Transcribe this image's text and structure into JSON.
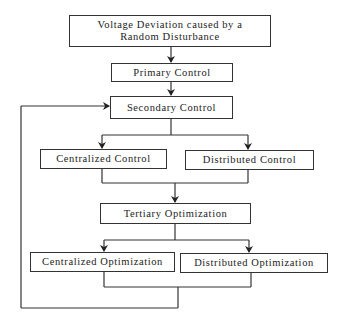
{
  "diagram": {
    "type": "flowchart",
    "nodes": {
      "disturbance": {
        "line1": "Voltage Deviation caused by a",
        "line2": "Random Disturbance"
      },
      "primary": {
        "label": "Primary Control"
      },
      "secondary": {
        "label": "Secondary Control"
      },
      "centralized_control": {
        "label": "Centralized Control"
      },
      "distributed_control": {
        "label": "Distributed Control"
      },
      "tertiary": {
        "label": "Tertiary Optimization"
      },
      "centralized_optimization": {
        "label": "Centralized Optimization"
      },
      "distributed_optimization": {
        "label": "Distributed Optimization"
      }
    },
    "edges": [
      {
        "from": "disturbance",
        "to": "primary"
      },
      {
        "from": "primary",
        "to": "secondary"
      },
      {
        "from": "secondary",
        "to": "centralized_control"
      },
      {
        "from": "secondary",
        "to": "distributed_control"
      },
      {
        "from": "centralized_control",
        "to": "tertiary"
      },
      {
        "from": "distributed_control",
        "to": "tertiary"
      },
      {
        "from": "tertiary",
        "to": "centralized_optimization"
      },
      {
        "from": "tertiary",
        "to": "distributed_optimization"
      },
      {
        "from": "centralized_optimization",
        "to": "secondary",
        "kind": "feedback"
      },
      {
        "from": "distributed_optimization",
        "to": "secondary",
        "kind": "feedback"
      }
    ]
  }
}
